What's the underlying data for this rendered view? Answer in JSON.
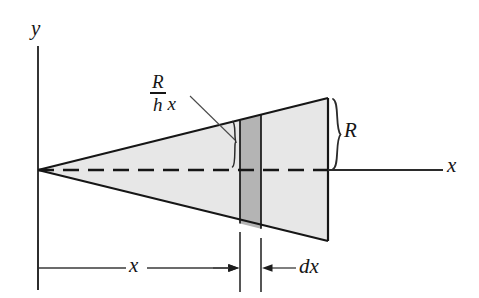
{
  "figure": {
    "axes": {
      "y_label": "y",
      "x_label": "x"
    },
    "labels": {
      "radius_at_x_numerator": "R",
      "radius_at_x_denominator": "h",
      "radius_at_x_variable": "x",
      "radius": "R",
      "thickness": "dx",
      "distance": "x"
    },
    "colors": {
      "cone_fill": "#e7e7e7",
      "slice_fill": "#b4b4b4",
      "stroke": "#161616",
      "background": "#ffffff",
      "thin_stroke": "#3a3a3a"
    },
    "geometry": {
      "apex": [
        38,
        170
      ],
      "base_x": 328,
      "base_top_y": 98,
      "base_bottom_y": 241,
      "slice_left_x": 240,
      "slice_right_x": 261,
      "axis_y": 170,
      "dimension_line_y": 268
    }
  }
}
